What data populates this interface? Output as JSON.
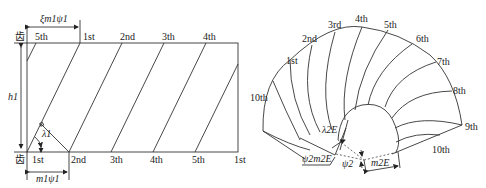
{
  "left_diagram": {
    "top_marker": "齿",
    "bottom_marker": "齿",
    "top_labels": [
      "5th",
      "1st",
      "2nd",
      "3th",
      "4th"
    ],
    "bottom_labels": [
      "1st",
      "2nd",
      "3th",
      "4th",
      "5th",
      "1st"
    ],
    "height_label": "h1",
    "top_dimension_label": "ξm1ψ1",
    "bottom_dimension_label": "m1ψ1",
    "angle_label": "λ1"
  },
  "right_diagram": {
    "outer_labels": [
      "1st",
      "2nd",
      "3rd",
      "4th",
      "5th",
      "6th",
      "7th",
      "8th",
      "9th",
      "10th"
    ],
    "left_edge_label": "10th",
    "bottom_edge_label": "10th",
    "angle_label": "λ2E",
    "psi_label": "ψ2",
    "arc_label": "ψ2m2E",
    "dimension_label": "m2E"
  }
}
